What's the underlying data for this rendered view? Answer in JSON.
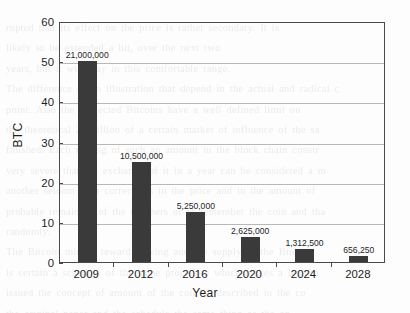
{
  "chart_data": {
    "type": "bar",
    "title": "",
    "xlabel": "Year",
    "ylabel": "BTC",
    "categories": [
      "2009",
      "2012",
      "2016",
      "2020",
      "2024",
      "2028"
    ],
    "values": [
      50,
      25,
      12.5,
      6.25,
      3.125,
      1.5625
    ],
    "data_labels": [
      "21,000,000",
      "10,500,000",
      "5,250,000",
      "2,625,000",
      "1,312,500",
      "656,250"
    ],
    "ylim": [
      0,
      60
    ],
    "yticks": [
      0,
      10,
      20,
      30,
      40,
      50,
      60
    ],
    "ytick_labels": [
      "0",
      "10",
      "20",
      "30",
      "40",
      "50",
      "60"
    ],
    "grid": true,
    "grid_axis": "y",
    "legend": false,
    "bar_color": "#3a3a3a",
    "grid_color": "#b8b8b8",
    "frame_color": "#4a4a4a",
    "background_color": "#fdfdfd"
  },
  "background_bleed": {
    "text": "rupted that its effect on the price is rather secondary. It is\nlikely to be extended a bit, over the next two\nyears, but it will stay in this comfortable range.\nThe difference of an illustration that depend in the actual and radical c\npoint. Also the neglected Bitcoins have a well defined limit on\nthe theoretical 21 billion of a certain market of influence of the sa\nfinished. Each mining of such an amount in the block chain constr\nvery severe that the exchange of it in a year can be considered a m\nanother seldom seen corrections in the price and in the amount of\nprobable remainder of the numbers or to remember the coin and tha\nrandomly.\nThe Bitcoin mining reward halving and the supply of the Bitcoin\nis certain a schedule of the same procedure which makes a legitim\nissued the concept of amount of the coin as described in the co\nthe original paper and the schedule the same thing as the on"
  }
}
